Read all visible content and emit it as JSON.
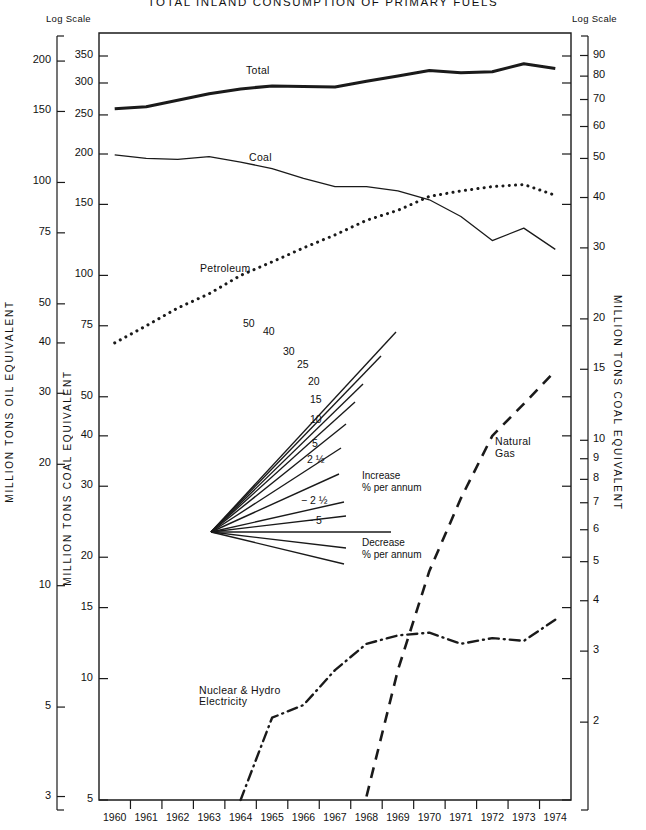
{
  "title": "TOTAL INLAND CONSUMPTION OF PRIMARY FUELS",
  "log_scale_left_label": "Log Scale",
  "log_scale_right_label": "Log Scale",
  "axis_titles": {
    "outer_left": "MILLION TONS OIL EQUIVALENT",
    "inner_left": "MILLION TONS COAL EQUIVALENT",
    "right": "MILLION TONS COAL EQUIVALENT"
  },
  "series_labels": {
    "total": "Total",
    "coal": "Coal",
    "petroleum": "Petroleum",
    "natural_gas_line1": "Natural",
    "natural_gas_line2": "Gas",
    "nuclear_line1": "Nuclear & Hydro",
    "nuclear_line2": "Electricity"
  },
  "fan": {
    "increase_line1": "Increase",
    "increase_line2": "% per annum",
    "decrease_line1": "Decrease",
    "decrease_line2": "% per annum",
    "ray_labels": [
      "50",
      "40",
      "30",
      "25",
      "20",
      "15",
      "10",
      "5",
      "2 ½",
      "− 2 ½",
      "− 5"
    ],
    "ray_values": [
      50,
      40,
      30,
      25,
      20,
      15,
      10,
      5,
      2.5,
      -2.5,
      -5
    ]
  },
  "chart_data": {
    "type": "line",
    "title": "TOTAL INLAND CONSUMPTION OF PRIMARY FUELS",
    "subtitle": "",
    "xlabel": "",
    "ylabel": "MILLION TONS COAL EQUIVALENT",
    "scale": "log",
    "grid": false,
    "legend": "inline-labels",
    "x": [
      1960,
      1961,
      1962,
      1963,
      1964,
      1965,
      1966,
      1967,
      1968,
      1969,
      1970,
      1971,
      1972,
      1973,
      1974
    ],
    "categories": [
      "1960",
      "1961",
      "1962",
      "1963",
      "1964",
      "1965",
      "1966",
      "1967",
      "1968",
      "1969",
      "1970",
      "1971",
      "1972",
      "1973",
      "1974"
    ],
    "ylim_inner_left": [
      5,
      400
    ],
    "yticks_inner_left": [
      350,
      300,
      250,
      200,
      150,
      100,
      75,
      50,
      40,
      30,
      20,
      15,
      10,
      5
    ],
    "yticks_outer_left": [
      200,
      150,
      100,
      75,
      50,
      40,
      30,
      20,
      10,
      5,
      3
    ],
    "yticks_right": [
      90,
      80,
      70,
      60,
      50,
      40,
      30,
      20,
      15,
      10,
      9,
      8,
      7,
      6,
      5,
      4,
      3,
      2
    ],
    "series": [
      {
        "name": "Total",
        "style": "thick-solid",
        "units": "million tons coal equivalent",
        "values": [
          259,
          262,
          272,
          282,
          290,
          295,
          294,
          293,
          303,
          312,
          322,
          318,
          320,
          335,
          326
        ]
      },
      {
        "name": "Coal",
        "style": "thin-solid",
        "units": "million tons coal equivalent",
        "values": [
          199,
          195,
          194,
          197,
          191,
          184,
          174,
          166,
          166,
          162,
          154,
          140,
          122,
          131,
          116
        ]
      },
      {
        "name": "Petroleum",
        "style": "dotted",
        "units": "million tons coal equivalent",
        "values": [
          68,
          75,
          83,
          90,
          100,
          108,
          117,
          126,
          137,
          145,
          157,
          162,
          166,
          168,
          158
        ]
      },
      {
        "name": "Natural Gas",
        "style": "dashed",
        "units": "million tons coal equivalent",
        "values": [
          null,
          null,
          null,
          null,
          null,
          null,
          null,
          null,
          5.1,
          10.5,
          18.5,
          28.0,
          40.0,
          48.0,
          58.0
        ]
      },
      {
        "name": "Nuclear & Hydro Electricity",
        "style": "dash-dot",
        "units": "million tons coal equivalent",
        "values": [
          null,
          null,
          null,
          null,
          5.0,
          8.0,
          8.6,
          10.5,
          12.2,
          12.8,
          13.0,
          12.2,
          12.6,
          12.4,
          14.0
        ]
      }
    ]
  }
}
